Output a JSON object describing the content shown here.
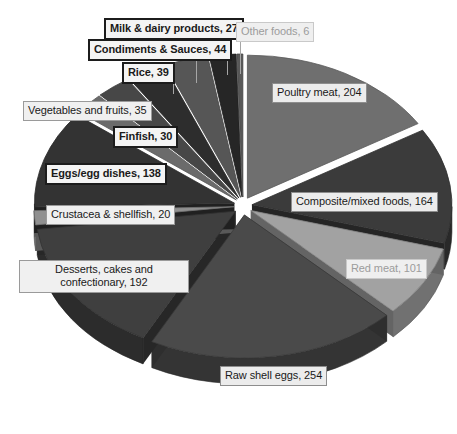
{
  "chart_data": {
    "type": "pie",
    "title": "",
    "subtitle": "",
    "xlabel": "",
    "ylabel": "",
    "legend_position": "none",
    "grid": false,
    "three_d": true,
    "total": 1254,
    "categories": [
      "Poultry meat",
      "Composite/mixed foods",
      "Red meat",
      "Raw shell eggs",
      "Desserts, cakes and confectionary",
      "Crustacea & shellfish",
      "Eggs/egg dishes",
      "Finfish",
      "Vegetables and fruits",
      "Rice",
      "Condiments & Sauces",
      "Milk & dairy products",
      "Other foods"
    ],
    "values": [
      204,
      164,
      101,
      254,
      192,
      20,
      138,
      30,
      35,
      39,
      44,
      27,
      6
    ],
    "slices": [
      {
        "label": "Poultry meat, 204",
        "name": "Poultry meat",
        "value": 204,
        "color": "#6f6f6f"
      },
      {
        "label": "Composite/mixed foods, 164",
        "name": "Composite/mixed foods",
        "value": 164,
        "color": "#3b3b3b"
      },
      {
        "label": "Red meat, 101",
        "name": "Red meat",
        "value": 101,
        "color": "#a2a2a2"
      },
      {
        "label": "Raw shell eggs, 254",
        "name": "Raw shell eggs",
        "value": 254,
        "color": "#4a4a4a"
      },
      {
        "label": "Desserts, cakes and confectionary, 192",
        "name": "Desserts, cakes and confectionary",
        "value": 192,
        "color": "#3f3f3f"
      },
      {
        "label": "Crustacea & shellfish, 20",
        "name": "Crustacea & shellfish",
        "value": 20,
        "color": "#909090"
      },
      {
        "label": "Eggs/egg dishes, 138",
        "name": "Eggs/egg dishes",
        "value": 138,
        "color": "#333333"
      },
      {
        "label": "Finfish, 30",
        "name": "Finfish",
        "value": 30,
        "color": "#6b6b6b"
      },
      {
        "label": "Vegetables and fruits, 35",
        "name": "Vegetables and fruits",
        "value": 35,
        "color": "#474747"
      },
      {
        "label": "Rice, 39",
        "name": "Rice",
        "value": 39,
        "color": "#2d2d2d"
      },
      {
        "label": "Condiments & Sauces, 44",
        "name": "Condiments & Sauces",
        "value": 44,
        "color": "#565656"
      },
      {
        "label": "Milk & dairy products, 27",
        "name": "Milk & dairy products",
        "value": 27,
        "color": "#262626"
      },
      {
        "label": "Other foods, 6",
        "name": "Other foods",
        "value": 6,
        "color": "#585858"
      }
    ],
    "colors": {
      "background": "#ffffff",
      "label_fill": "#f0f0f0",
      "label_border": "#9a9a9a",
      "label_text": "#1a1a1a",
      "muted_text": "#9c9c9c",
      "leader_line": "#a6a6a6"
    }
  },
  "labels": {
    "milk_dairy": "Milk & dairy products, 27",
    "condiments": "Condiments & Sauces, 44",
    "rice": "Rice, 39",
    "vegetables": "Vegetables and fruits, 35",
    "finfish": "Finfish, 30",
    "eggs_dishes": "Eggs/egg dishes, 138",
    "crustacea": "Crustacea & shellfish, 20",
    "desserts": "Desserts, cakes and confectionary, 192",
    "raw_shell_eggs": "Raw shell eggs, 254",
    "red_meat": "Red meat, 101",
    "composite": "Composite/mixed foods, 164",
    "poultry": "Poultry meat, 204",
    "other_foods": "Other foods, 6"
  }
}
